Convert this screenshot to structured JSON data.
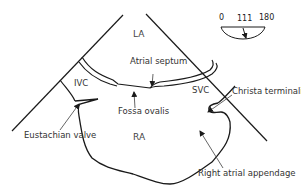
{
  "diagram": {
    "type": "echocardiography-anatomy-schematic",
    "chambers": {
      "la": "LA",
      "ra": "RA"
    },
    "vessels": {
      "ivc": "IVC",
      "svc": "SVC"
    },
    "labels": {
      "atrial_septum": "Atrial septum",
      "fossa_ovalis": "Fossa ovalis",
      "eustachian_valve": "Eustachian valve",
      "christa_terminalis": "Christa terminalis",
      "right_atrial_appendage": "Right atrial appendage"
    },
    "angle_indicator": {
      "min": "0",
      "value": "111",
      "max": "180"
    },
    "colors": {
      "line": "#1a1a1a",
      "leader": "#555555",
      "text": "#333333",
      "background": "#ffffff"
    }
  }
}
